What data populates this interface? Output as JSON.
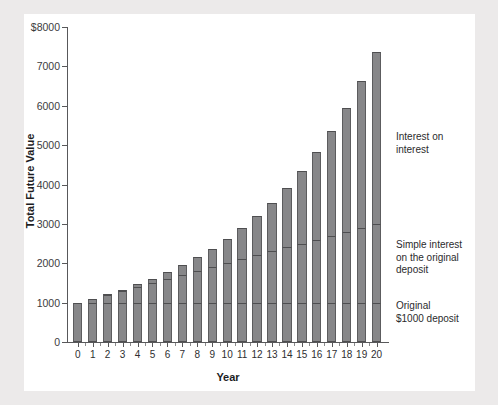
{
  "chart_data": {
    "type": "bar",
    "subtype": "stacked-bar",
    "title": "",
    "xlabel": "Year",
    "ylabel": "Total Future Value",
    "categories": [
      "0",
      "1",
      "2",
      "3",
      "4",
      "5",
      "6",
      "7",
      "8",
      "9",
      "10",
      "11",
      "12",
      "13",
      "14",
      "15",
      "16",
      "17",
      "18",
      "19",
      "20"
    ],
    "x": [
      0,
      1,
      2,
      3,
      4,
      5,
      6,
      7,
      8,
      9,
      10,
      11,
      12,
      13,
      14,
      15,
      16,
      17,
      18,
      19,
      20
    ],
    "ylim": [
      0,
      8000
    ],
    "yticks": [
      0,
      1000,
      2000,
      3000,
      4000,
      5000,
      6000,
      7000,
      8000
    ],
    "ytick_labels": [
      "0",
      "1000",
      "2000",
      "3000",
      "4000",
      "5000",
      "6000",
      "7000",
      "$8000"
    ],
    "grid": false,
    "legend_position": "right",
    "series": [
      {
        "name": "Original $1000 deposit",
        "values": [
          1000,
          1000,
          1000,
          1000,
          1000,
          1000,
          1000,
          1000,
          1000,
          1000,
          1000,
          1000,
          1000,
          1000,
          1000,
          1000,
          1000,
          1000,
          1000,
          1000,
          1000
        ]
      },
      {
        "name": "Simple interest on the original deposit",
        "values": [
          0,
          100,
          200,
          300,
          400,
          500,
          600,
          700,
          800,
          900,
          1000,
          1100,
          1200,
          1300,
          1400,
          1500,
          1600,
          1700,
          1800,
          1900,
          2000
        ]
      },
      {
        "name": "Interest on interest",
        "values": [
          0,
          0,
          10,
          31,
          64,
          110,
          172,
          250,
          348,
          468,
          612,
          785,
          990,
          1231,
          1512,
          1838,
          2216,
          2650,
          3150,
          3721,
          4372
        ]
      }
    ],
    "totals": [
      1000,
      1100,
      1210,
      1331,
      1464,
      1610,
      1772,
      1950,
      2148,
      2368,
      2612,
      2885,
      3190,
      3531,
      3912,
      4338,
      4816,
      5350,
      5950,
      6621,
      7372
    ]
  },
  "legend": {
    "items": [
      {
        "id": "interest-on-interest",
        "label": "Interest on\ninterest",
        "line1": "Interest on",
        "line2": "interest"
      },
      {
        "id": "simple-interest",
        "label": "Simple interest on the original deposit",
        "line1": "Simple interest",
        "line2": "on the original",
        "line3": "deposit"
      },
      {
        "id": "original-deposit",
        "label": "Original $1000 deposit",
        "line1": "Original",
        "line2": "$1000 deposit"
      }
    ]
  },
  "colors": {
    "bar_fill": "#878789",
    "bar_stroke": "#4e4e50",
    "axis": "#58585a",
    "text": "#1d1d1f",
    "card_bg": "#ffffff",
    "page_bg": "#eceaea"
  }
}
